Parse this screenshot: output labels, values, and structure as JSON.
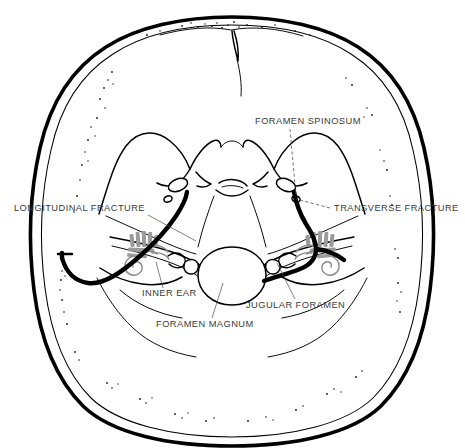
{
  "figure": {
    "view": "superior view of skull base (internal cranial base)",
    "background_color": "#ffffff",
    "ink_color": "#000000",
    "label_color": "#3a3a3a",
    "shading_color": "#9a9a9a"
  },
  "labels": [
    {
      "id": "longitudinal-fracture",
      "text": "LONGITUDINAL FRACTURE",
      "side": "left",
      "align": "start",
      "x": 14,
      "y": 211,
      "leader": {
        "type": "solid",
        "from_x": 148,
        "from_y": 215,
        "to_x": 196,
        "to_y": 241
      }
    },
    {
      "id": "transverse-fracture",
      "text": "TRANSVERSE FRACTURE",
      "side": "right",
      "align": "start",
      "x": 334,
      "y": 211,
      "leader": {
        "type": "dashed",
        "from_x": 330,
        "from_y": 208,
        "to_x": 296,
        "to_y": 199
      }
    },
    {
      "id": "foramen-spinosum",
      "text": "FORAMEN SPINOSUM",
      "side": "right",
      "align": "start",
      "x": 255,
      "y": 124,
      "leader": {
        "type": "dashed",
        "from_x": 290,
        "from_y": 129,
        "to_x": 296,
        "to_y": 196
      }
    },
    {
      "id": "inner-ear",
      "text": "INNER EAR",
      "side": "left",
      "align": "start",
      "x": 142,
      "y": 296,
      "leader": {
        "type": "solid",
        "from_x": 163,
        "from_y": 288,
        "to_x": 156,
        "to_y": 262
      }
    },
    {
      "id": "jugular-foramen",
      "text": "JUGULAR FORAMEN",
      "side": "right",
      "align": "start",
      "x": 246,
      "y": 308,
      "leader": {
        "type": "solid",
        "from_x": 295,
        "from_y": 299,
        "to_x": 277,
        "to_y": 263
      }
    },
    {
      "id": "foramen-magnum",
      "text": "FORAMEN MAGNUM",
      "side": "center",
      "align": "start",
      "x": 156,
      "y": 327,
      "leader": {
        "type": "solid",
        "from_x": 212,
        "from_y": 318,
        "to_x": 223,
        "to_y": 283
      }
    }
  ],
  "structures": [
    {
      "id": "cranial-vault",
      "name": "cranial vault outline"
    },
    {
      "id": "anterior-cranial-fossa",
      "name": "anterior cranial fossa"
    },
    {
      "id": "sphenoid-lesser-wing-left",
      "name": "left lesser wing of sphenoid"
    },
    {
      "id": "sphenoid-lesser-wing-right",
      "name": "right lesser wing of sphenoid"
    },
    {
      "id": "sella-turcica",
      "name": "sella turcica"
    },
    {
      "id": "petrous-ridge-left",
      "name": "left petrous ridge"
    },
    {
      "id": "petrous-ridge-right",
      "name": "right petrous ridge"
    },
    {
      "id": "foramen-magnum-opening",
      "name": "foramen magnum"
    },
    {
      "id": "posterior-cranial-fossa",
      "name": "posterior cranial fossa"
    },
    {
      "id": "inner-ear-left",
      "name": "left inner ear labyrinth"
    },
    {
      "id": "inner-ear-right",
      "name": "right inner ear labyrinth"
    },
    {
      "id": "fracture-longitudinal",
      "name": "longitudinal temporal bone fracture"
    },
    {
      "id": "fracture-transverse",
      "name": "transverse temporal bone fracture"
    }
  ]
}
